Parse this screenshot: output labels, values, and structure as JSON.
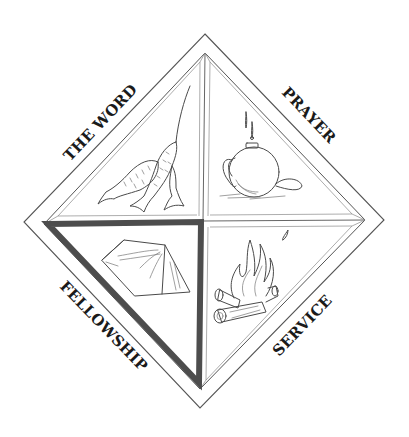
{
  "emblem": {
    "description": "Diamond-shaped emblem divided into four quadrants with labels along each outer edge",
    "colors": {
      "background": "#ffffff",
      "outline": "#555555",
      "highlight_border": "#4d4d4d",
      "label": "#1a1a1a"
    },
    "quadrants": [
      {
        "id": "top-left",
        "label": "THE WORD",
        "illustration": "two-fish-on-line",
        "icon": "fish-icon",
        "highlighted": false
      },
      {
        "id": "top-right",
        "label": "PRAYER",
        "illustration": "canteen-with-dripping-water",
        "icon": "canteen-icon",
        "highlighted": false
      },
      {
        "id": "bottom-left",
        "label": "FELLOWSHIP",
        "illustration": "tent",
        "icon": "tent-icon",
        "highlighted": true
      },
      {
        "id": "bottom-right",
        "label": "SERVICE",
        "illustration": "campfire-with-logs",
        "icon": "campfire-icon",
        "highlighted": false
      }
    ]
  }
}
